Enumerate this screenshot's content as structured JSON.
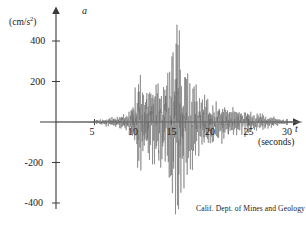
{
  "figure": {
    "credit": "Calif. Dept. of Mines and Geology",
    "y_axis_symbol": "a",
    "y_axis_unit_prefix": "(cm/s",
    "y_axis_unit_exponent": "2",
    "y_axis_unit_suffix": ")",
    "x_axis_symbol": "t",
    "x_axis_unit": "(seconds)"
  },
  "chart_data": {
    "type": "line",
    "title": "",
    "subtitle": "",
    "xlabel": "t",
    "xlabel_unit": "(seconds)",
    "ylabel": "a",
    "ylabel_unit": "(cm/s^2)",
    "grid": false,
    "legend": false,
    "xlim": [
      0,
      32
    ],
    "ylim": [
      -500,
      520
    ],
    "xticks": [
      5,
      10,
      15,
      20,
      25,
      30
    ],
    "xtick_labels": [
      "5",
      "10",
      "15",
      "20",
      "25",
      "30"
    ],
    "yticks": [
      400,
      200,
      -200,
      -400
    ],
    "ytick_labels": [
      "400",
      "200",
      "-200",
      "-400"
    ],
    "series_name": "ground acceleration",
    "trace_color": "#6e6e6e",
    "axis_color": "#3a3a3a",
    "peak_time": 15.7,
    "peak_value": 480,
    "min_time": 15.9,
    "min_value": -430,
    "sample_interval": 0.02,
    "seed": 20250117,
    "envelope": [
      {
        "t": 0.0,
        "amp": 0
      },
      {
        "t": 4.6,
        "amp": 2
      },
      {
        "t": 5.2,
        "amp": 10
      },
      {
        "t": 6.5,
        "amp": 16
      },
      {
        "t": 8.0,
        "amp": 26
      },
      {
        "t": 9.2,
        "amp": 40
      },
      {
        "t": 10.0,
        "amp": 70
      },
      {
        "t": 10.6,
        "amp": 230
      },
      {
        "t": 11.2,
        "amp": 150
      },
      {
        "t": 11.9,
        "amp": 210
      },
      {
        "t": 12.6,
        "amp": 160
      },
      {
        "t": 13.3,
        "amp": 250
      },
      {
        "t": 13.9,
        "amp": 180
      },
      {
        "t": 14.6,
        "amp": 300
      },
      {
        "t": 15.2,
        "amp": 360
      },
      {
        "t": 15.7,
        "amp": 490
      },
      {
        "t": 16.1,
        "amp": 430
      },
      {
        "t": 16.7,
        "amp": 300
      },
      {
        "t": 17.4,
        "amp": 230
      },
      {
        "t": 18.2,
        "amp": 170
      },
      {
        "t": 19.0,
        "amp": 120
      },
      {
        "t": 20.0,
        "amp": 95
      },
      {
        "t": 21.2,
        "amp": 80
      },
      {
        "t": 22.5,
        "amp": 70
      },
      {
        "t": 24.0,
        "amp": 60
      },
      {
        "t": 25.5,
        "amp": 50
      },
      {
        "t": 27.0,
        "amp": 38
      },
      {
        "t": 28.2,
        "amp": 26
      },
      {
        "t": 29.2,
        "amp": 14
      },
      {
        "t": 30.0,
        "amp": 6
      },
      {
        "t": 31.5,
        "amp": 2
      }
    ]
  }
}
